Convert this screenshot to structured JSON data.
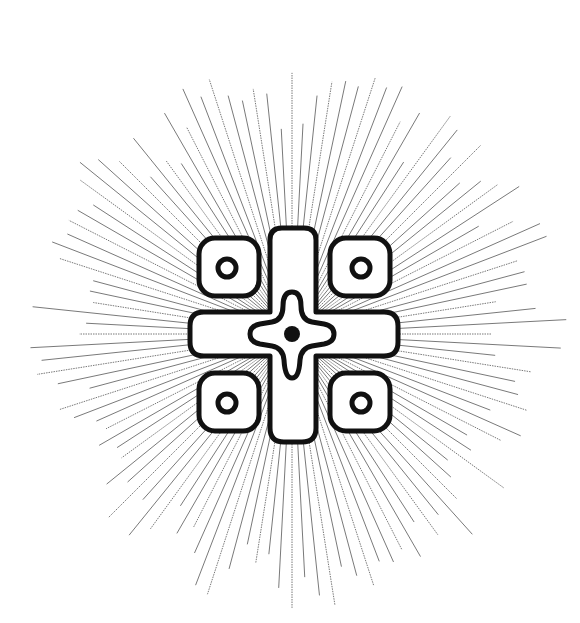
{
  "emblem": {
    "name": "cross-with-four-rings-sunburst",
    "center": [
      292,
      334
    ],
    "colors": {
      "background": "#ffffff",
      "stroke": "#111111",
      "ray": "#6a6a6a",
      "fill": "#ffffff"
    },
    "rays": {
      "count": 120,
      "inner_radius": 20,
      "outer_min": 200,
      "outer_max": 275
    }
  }
}
